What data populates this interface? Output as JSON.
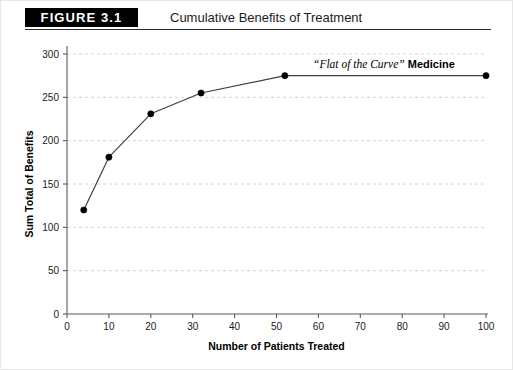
{
  "header": {
    "figure_badge": "FIGURE 3.1",
    "title": "Cumulative Benefits of Treatment"
  },
  "annotation": {
    "quote": "“Flat of the Curve”",
    "word": "Medicine"
  },
  "colors": {
    "banner_background": "#000000",
    "banner_text": "#ffffff",
    "axis": "#5a5a5a",
    "grid": "#c6c6c6",
    "line": "#404040",
    "marker": "#000000",
    "page_background": "#ffffff"
  },
  "chart_data": {
    "type": "line",
    "title": "Cumulative Benefits of Treatment",
    "xlabel": "Number of Patients Treated",
    "ylabel": "Sum Total of Benefits",
    "xlim": [
      0,
      100
    ],
    "ylim": [
      0,
      300
    ],
    "xticks": [
      0,
      10,
      20,
      30,
      40,
      50,
      60,
      70,
      80,
      90,
      100
    ],
    "yticks": [
      0,
      50,
      100,
      150,
      200,
      250,
      300
    ],
    "grid": "horizontal-dashed",
    "legend": "none",
    "markers": true,
    "annotations": [
      {
        "text": "“Flat of the Curve” Medicine",
        "x": 58,
        "y": 292
      }
    ],
    "series": [
      {
        "name": "Cumulative Benefits",
        "x": [
          4,
          10,
          20,
          32,
          52,
          100
        ],
        "y": [
          120,
          181,
          231,
          255,
          275,
          275
        ]
      }
    ]
  }
}
